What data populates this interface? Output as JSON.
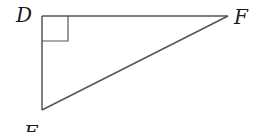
{
  "diagram": {
    "type": "right-triangle",
    "vertices": {
      "D": {
        "label": "D",
        "x": 42,
        "y": 16
      },
      "F": {
        "label": "F",
        "x": 228,
        "y": 16
      },
      "E": {
        "label": "E",
        "x": 42,
        "y": 110
      }
    },
    "right_angle_at": "D",
    "right_angle_marker_size": 26,
    "stroke_color": "#555555",
    "label_color": "#1a1a1a"
  }
}
